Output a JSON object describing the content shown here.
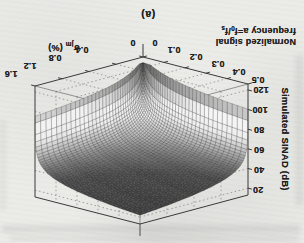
{
  "figure": {
    "caption": "(a)",
    "x_axis": {
      "title_line1": "Normalized signal",
      "title_line2_pre": "frequency a=f",
      "title_line2_sub1": "0",
      "title_line2_mid": "/f",
      "title_line2_sub2": "s",
      "tick_labels": [
        "0",
        "0.1",
        "0.2",
        "0.3",
        "0.4",
        "0.5"
      ]
    },
    "y_axis": {
      "title_symbol": "σ",
      "title_subscript": "jm",
      "title_unit": "(%)",
      "tick_labels": [
        "0",
        "0.4",
        "0.8",
        "1.2",
        "1.6"
      ]
    },
    "z_axis": {
      "title": "Simulated SINAD (dB)",
      "tick_labels": [
        "20",
        "40",
        "60",
        "80",
        "100",
        "120"
      ]
    }
  },
  "chart_data": {
    "type": "surface",
    "xlabel": "Normalized signal frequency a=f0/fs",
    "ylabel": "σjm (%)",
    "zlabel": "Simulated SINAD (dB)",
    "x_ticks": [
      0,
      0.1,
      0.2,
      0.3,
      0.4,
      0.5
    ],
    "y_ticks": [
      0,
      0.4,
      0.8,
      1.2,
      1.6
    ],
    "z_ticks": [
      20,
      40,
      60,
      80,
      100,
      120
    ],
    "xlim": [
      0,
      0.5
    ],
    "ylim": [
      0,
      1.6
    ],
    "zlim": [
      20,
      120
    ],
    "grid": true,
    "orientation": "figure printed rotated 180 degrees (upside-down scan)",
    "surface_peak_db": 120,
    "surface_min_db": 22,
    "a_values": [
      0,
      0.1,
      0.2,
      0.3,
      0.4,
      0.5
    ],
    "sigma_values": [
      0,
      0.4,
      0.8,
      1.2,
      1.6
    ],
    "z_grid_db": [
      [
        120,
        107,
        101,
        98,
        95
      ],
      [
        114,
        48,
        42,
        38,
        36
      ],
      [
        108,
        42,
        36,
        32,
        30
      ],
      [
        105,
        38,
        32,
        29,
        26
      ],
      [
        102,
        36,
        30,
        26,
        24
      ],
      [
        100,
        34,
        28,
        25,
        22
      ]
    ],
    "model": {
      "A": 0.0628319,
      "ka": 1.2e-05,
      "ks": 6.9e-06,
      "n0": 5e-07,
      "offset": -4,
      "cap": 120
    }
  },
  "theme": {
    "paper": "#ebebe8",
    "ink": "#1f1f1f",
    "box_edge": "#3a3a3a",
    "grid_dotted": "#8a8a8a",
    "surface_dark": "#3d3d3d",
    "surface_light": "#f2f2f0"
  }
}
